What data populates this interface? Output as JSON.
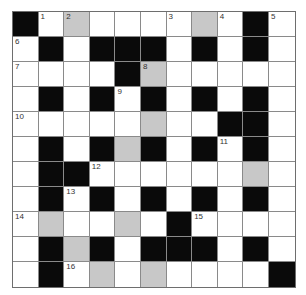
{
  "puzzle": {
    "rows": 11,
    "cols": 11,
    "legend": {
      "B": "black block",
      "W": "white answer cell",
      "G": "shaded answer cell"
    },
    "colors": {
      "black": "#0a0a0a",
      "shaded": "#c8c8c8",
      "white": "#ffffff",
      "grid_line": "#8a8a8a"
    },
    "grid": [
      [
        "B",
        "W",
        "G",
        "W",
        "W",
        "W",
        "W",
        "G",
        "W",
        "B",
        "W"
      ],
      [
        "W",
        "B",
        "W",
        "B",
        "B",
        "B",
        "W",
        "B",
        "W",
        "B",
        "W"
      ],
      [
        "W",
        "W",
        "W",
        "W",
        "B",
        "G",
        "W",
        "W",
        "W",
        "W",
        "W"
      ],
      [
        "W",
        "B",
        "W",
        "B",
        "W",
        "B",
        "W",
        "B",
        "W",
        "B",
        "W"
      ],
      [
        "W",
        "W",
        "W",
        "W",
        "W",
        "G",
        "W",
        "W",
        "B",
        "B",
        "W"
      ],
      [
        "W",
        "B",
        "W",
        "B",
        "G",
        "B",
        "W",
        "B",
        "W",
        "B",
        "W"
      ],
      [
        "W",
        "B",
        "B",
        "W",
        "W",
        "W",
        "W",
        "W",
        "W",
        "G",
        "W"
      ],
      [
        "W",
        "B",
        "W",
        "B",
        "W",
        "B",
        "W",
        "B",
        "W",
        "B",
        "W"
      ],
      [
        "W",
        "G",
        "W",
        "W",
        "G",
        "W",
        "B",
        "W",
        "W",
        "W",
        "W"
      ],
      [
        "W",
        "B",
        "G",
        "B",
        "W",
        "B",
        "B",
        "B",
        "W",
        "B",
        "W"
      ],
      [
        "W",
        "B",
        "W",
        "G",
        "W",
        "G",
        "W",
        "W",
        "W",
        "W",
        "B"
      ]
    ],
    "numbers": [
      {
        "n": "1",
        "r": 0,
        "c": 1
      },
      {
        "n": "2",
        "r": 0,
        "c": 2
      },
      {
        "n": "3",
        "r": 0,
        "c": 6
      },
      {
        "n": "4",
        "r": 0,
        "c": 8
      },
      {
        "n": "5",
        "r": 0,
        "c": 10
      },
      {
        "n": "6",
        "r": 1,
        "c": 0
      },
      {
        "n": "7",
        "r": 2,
        "c": 0
      },
      {
        "n": "8",
        "r": 2,
        "c": 5
      },
      {
        "n": "9",
        "r": 3,
        "c": 4
      },
      {
        "n": "10",
        "r": 4,
        "c": 0
      },
      {
        "n": "11",
        "r": 5,
        "c": 8
      },
      {
        "n": "12",
        "r": 6,
        "c": 3
      },
      {
        "n": "13",
        "r": 7,
        "c": 2
      },
      {
        "n": "14",
        "r": 8,
        "c": 0
      },
      {
        "n": "15",
        "r": 8,
        "c": 7
      },
      {
        "n": "16",
        "r": 10,
        "c": 2
      }
    ]
  }
}
